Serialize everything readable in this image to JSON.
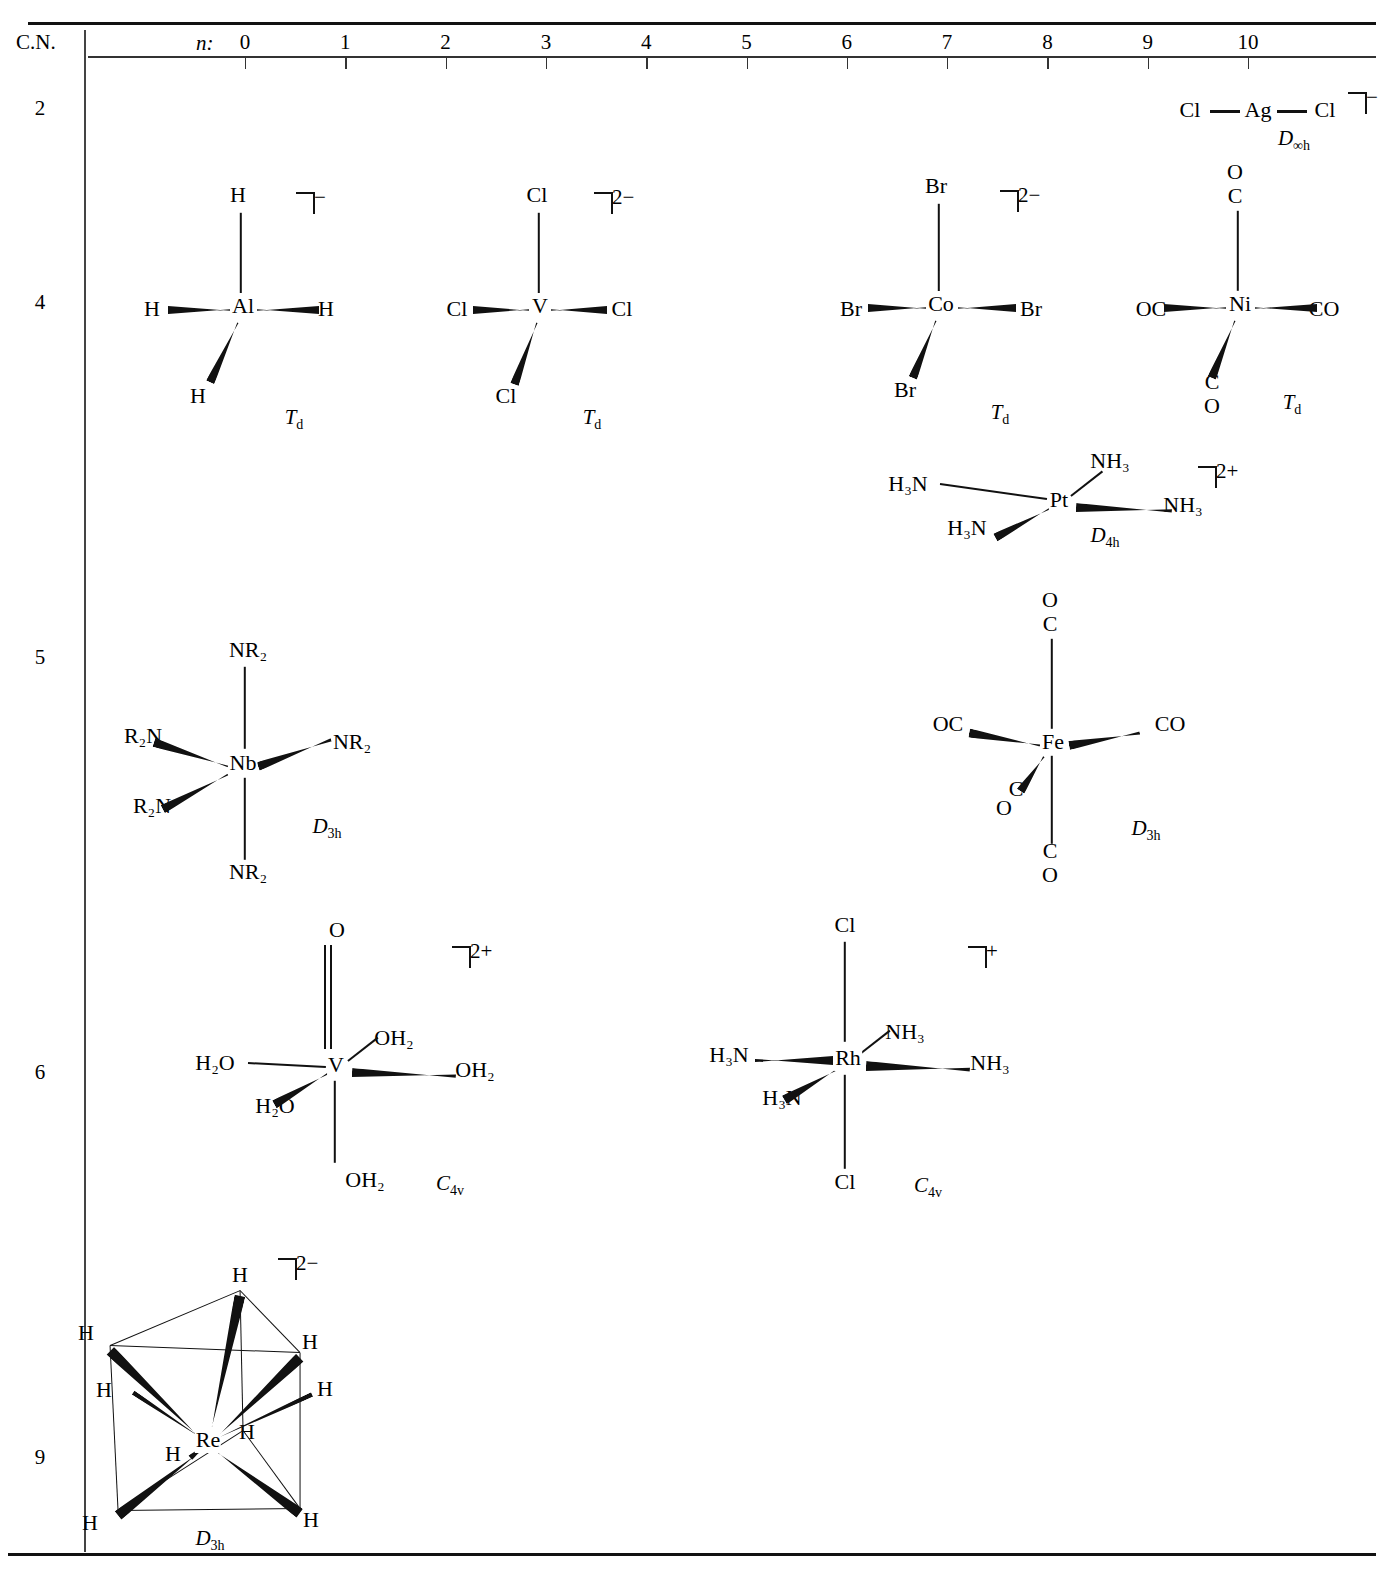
{
  "axis": {
    "cn_header": "C.N.",
    "n_symbol": "n:",
    "ticks": [
      "0",
      "1",
      "2",
      "3",
      "4",
      "5",
      "6",
      "7",
      "8",
      "9",
      "10"
    ]
  },
  "rows": [
    {
      "cn": "2"
    },
    {
      "cn": "4"
    },
    {
      "cn": "5"
    },
    {
      "cn": "6"
    },
    {
      "cn": "9"
    }
  ],
  "molecules": [
    {
      "id": "agcl2",
      "cn": "2",
      "n": 10,
      "center": "Ag",
      "charge": "−",
      "symmetry": "D",
      "symmetry_sub": "∞h",
      "geometry": "linear",
      "ligands": [
        "Cl",
        "Cl"
      ]
    },
    {
      "id": "alh4",
      "cn": "4",
      "n": 0,
      "center": "Al",
      "charge": "−",
      "symmetry": "T",
      "symmetry_sub": "d",
      "geometry": "tetrahedral",
      "ligands": [
        "H",
        "H",
        "H",
        "H"
      ]
    },
    {
      "id": "vcl4",
      "cn": "4",
      "n": 3,
      "center": "V",
      "charge": "2−",
      "symmetry": "T",
      "symmetry_sub": "d",
      "geometry": "tetrahedral",
      "ligands": [
        "Cl",
        "Cl",
        "Cl",
        "Cl"
      ]
    },
    {
      "id": "cobr4",
      "cn": "4",
      "n": 7,
      "center": "Co",
      "charge": "2−",
      "symmetry": "T",
      "symmetry_sub": "d",
      "geometry": "tetrahedral",
      "ligands": [
        "Br",
        "Br",
        "Br",
        "Br"
      ]
    },
    {
      "id": "nico4",
      "cn": "4",
      "n": 10,
      "center": "Ni",
      "charge": "",
      "symmetry": "T",
      "symmetry_sub": "d",
      "geometry": "tetrahedral",
      "ligands": [
        "OC",
        "CO",
        "CO",
        "CO"
      ]
    },
    {
      "id": "ptnh3-4",
      "cn": "4",
      "n": 8,
      "center": "Pt",
      "charge": "2+",
      "symmetry": "D",
      "symmetry_sub": "4h",
      "geometry": "square-planar",
      "ligands": [
        "H₃N",
        "H₃N",
        "NH₃",
        "NH₃"
      ]
    },
    {
      "id": "nbnr2-5",
      "cn": "5",
      "n": 0,
      "center": "Nb",
      "charge": "",
      "symmetry": "D",
      "symmetry_sub": "3h",
      "geometry": "trigonal-bipyramidal",
      "ligands": [
        "NR₂",
        "R₂N",
        "R₂N",
        "NR₂",
        "NR₂"
      ]
    },
    {
      "id": "feco5",
      "cn": "5",
      "n": 8,
      "center": "Fe",
      "charge": "",
      "symmetry": "D",
      "symmetry_sub": "3h",
      "geometry": "trigonal-bipyramidal",
      "ligands": [
        "OC",
        "CO",
        "CO",
        "CO",
        "CO"
      ]
    },
    {
      "id": "voh2-5",
      "cn": "6",
      "n": 3,
      "center": "V",
      "charge": "2+",
      "symmetry": "C",
      "symmetry_sub": "4v",
      "geometry": "octahedral",
      "ligands": [
        "O",
        "H₂O",
        "H₂O",
        "OH₂",
        "OH₂",
        "OH₂"
      ]
    },
    {
      "id": "rhcl2nh3-4",
      "cn": "6",
      "n": 7,
      "center": "Rh",
      "charge": "+",
      "symmetry": "C",
      "symmetry_sub": "4v",
      "geometry": "octahedral",
      "ligands": [
        "Cl",
        "Cl",
        "H₃N",
        "H₃N",
        "NH₃",
        "NH₃"
      ]
    },
    {
      "id": "reh9",
      "cn": "9",
      "n": 0,
      "center": "Re",
      "charge": "2−",
      "symmetry": "D",
      "symmetry_sub": "3h",
      "geometry": "tricapped-trigonal-prismatic",
      "ligands": [
        "H",
        "H",
        "H",
        "H",
        "H",
        "H",
        "H",
        "H",
        "H"
      ]
    }
  ],
  "labels": {
    "agcl2": {
      "l1": "Cl",
      "l2": "Cl",
      "center": "Ag",
      "sym": "D",
      "sub": "∞h",
      "charge": "−"
    },
    "alh4": {
      "top": "H",
      "left": "H",
      "right": "H",
      "bottom": "H",
      "center": "Al",
      "sym": "T",
      "sub": "d",
      "charge": "−"
    },
    "vcl4": {
      "top": "Cl",
      "left": "Cl",
      "right": "Cl",
      "bottom": "Cl",
      "center": "V",
      "sym": "T",
      "sub": "d",
      "charge": "2−"
    },
    "cobr4": {
      "top": "Br",
      "left": "Br",
      "right": "Br",
      "bottom": "Br",
      "center": "Co",
      "sym": "T",
      "sub": "d",
      "charge": "2−"
    },
    "nico4": {
      "top_o": "O",
      "top_c": "C",
      "left": "OC",
      "right": "CO",
      "bot_c": "C",
      "bot_o": "O",
      "center": "Ni",
      "sym": "T",
      "sub": "d"
    },
    "pt": {
      "upleft": "H₃N",
      "downleft": "H₃N",
      "upright": "NH₃",
      "right": "NH₃",
      "center": "Pt",
      "sym": "D",
      "sub": "4h",
      "charge": "2+"
    },
    "nb": {
      "top": "NR₂",
      "upleft": "R₂N",
      "downleft": "R₂N",
      "right": "NR₂",
      "bottom": "NR₂",
      "center": "Nb",
      "sym": "D",
      "sub": "3h"
    },
    "fe": {
      "top_o": "O",
      "top_c": "C",
      "left": "OC",
      "right": "CO",
      "low_c": "C",
      "low_o": "O",
      "bot_c": "C",
      "bot_o": "O",
      "center": "Fe",
      "sym": "D",
      "sub": "3h"
    },
    "vo": {
      "top": "O",
      "left": "H₂O",
      "downleft": "H₂O",
      "upright": "OH₂",
      "right": "OH₂",
      "bottom": "OH₂",
      "center": "V",
      "sym": "C",
      "sub": "4v",
      "charge": "2+"
    },
    "rh": {
      "top": "Cl",
      "left": "H₃N",
      "downleft": "H₃N",
      "upright": "NH₃",
      "right": "NH₃",
      "bottom": "Cl",
      "center": "Rh",
      "sym": "C",
      "sub": "4v",
      "charge": "+"
    },
    "re": {
      "h": "H",
      "center": "Re",
      "sym": "D",
      "sub": "3h",
      "charge": "2−"
    }
  }
}
